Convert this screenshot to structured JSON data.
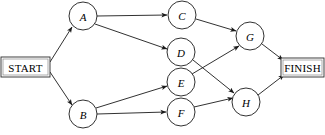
{
  "diagram": {
    "type": "directed-graph",
    "canvas": {
      "width": 325,
      "height": 135,
      "background": "#ffffff"
    },
    "style": {
      "line_color": "#1a1a1a",
      "node_fill": "#ffffff",
      "node_stroke": "#1a1a1a",
      "node_radius": 14,
      "terminal_border": "#2b2b2b"
    },
    "terminals": [
      {
        "id": "START",
        "label": "START",
        "shape": "rect",
        "x": 1,
        "y": 57,
        "width": 49,
        "height": 20
      },
      {
        "id": "FINISH",
        "label": "FINISH",
        "shape": "rect",
        "x": 281,
        "y": 58,
        "width": 43,
        "height": 19
      }
    ],
    "nodes": [
      {
        "id": "A",
        "label": "A",
        "cx": 83,
        "cy": 16,
        "r": 14
      },
      {
        "id": "B",
        "label": "B",
        "cx": 83,
        "cy": 114,
        "r": 14
      },
      {
        "id": "C",
        "label": "C",
        "cx": 182,
        "cy": 15,
        "r": 14
      },
      {
        "id": "D",
        "label": "D",
        "cx": 181,
        "cy": 52,
        "r": 14
      },
      {
        "id": "E",
        "label": "E",
        "cx": 181,
        "cy": 82,
        "r": 14
      },
      {
        "id": "F",
        "label": "F",
        "cx": 181,
        "cy": 112,
        "r": 14
      },
      {
        "id": "G",
        "label": "G",
        "cx": 250,
        "cy": 36,
        "r": 14
      },
      {
        "id": "H",
        "label": "H",
        "cx": 246,
        "cy": 102,
        "r": 14
      }
    ],
    "edges": [
      {
        "from": "START",
        "to": "A",
        "x1": 50,
        "y1": 62,
        "x2": 72,
        "y2": 27
      },
      {
        "from": "START",
        "to": "B",
        "x1": 50,
        "y1": 72,
        "x2": 72,
        "y2": 105
      },
      {
        "from": "A",
        "to": "C",
        "x1": 97,
        "y1": 16,
        "x2": 167,
        "y2": 15
      },
      {
        "from": "A",
        "to": "D",
        "x1": 95,
        "y1": 24,
        "x2": 167,
        "y2": 49
      },
      {
        "from": "B",
        "to": "E",
        "x1": 96,
        "y1": 108,
        "x2": 167,
        "y2": 86
      },
      {
        "from": "B",
        "to": "F",
        "x1": 97,
        "y1": 114,
        "x2": 166,
        "y2": 112
      },
      {
        "from": "C",
        "to": "G",
        "x1": 196,
        "y1": 19,
        "x2": 236,
        "y2": 31
      },
      {
        "from": "D",
        "to": "H",
        "x1": 193,
        "y1": 60,
        "x2": 234,
        "y2": 93
      },
      {
        "from": "E",
        "to": "G",
        "x1": 192,
        "y1": 74,
        "x2": 239,
        "y2": 46
      },
      {
        "from": "F",
        "to": "H",
        "x1": 194,
        "y1": 107,
        "x2": 233,
        "y2": 98
      },
      {
        "from": "G",
        "to": "FINISH",
        "x1": 262,
        "y1": 44,
        "x2": 283,
        "y2": 60
      },
      {
        "from": "H",
        "to": "FINISH",
        "x1": 258,
        "y1": 95,
        "x2": 284,
        "y2": 75
      }
    ]
  }
}
